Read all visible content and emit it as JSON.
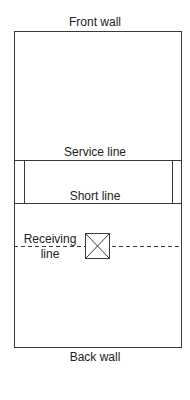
{
  "diagram": {
    "labels": {
      "front_wall": "Front wall",
      "service_line": "Service line",
      "short_line": "Short line",
      "receiving_line_1": "Receiving",
      "receiving_line_2": "line",
      "back_wall": "Back wall"
    },
    "colors": {
      "line": "#3a3a3a",
      "background": "#ffffff"
    }
  }
}
